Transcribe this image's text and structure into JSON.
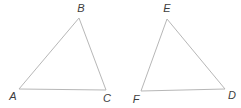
{
  "canvas": {
    "width": 241,
    "height": 108,
    "background": "#ffffff",
    "line_color": "#b7b7b7",
    "label_color": "#3d3d3d"
  },
  "figures": [
    {
      "name": "triangle-ABC",
      "vertices": [
        {
          "label": "A",
          "x": 19,
          "y": 89,
          "label_x": 13,
          "label_y": 96
        },
        {
          "label": "B",
          "x": 79,
          "y": 18,
          "label_x": 81,
          "label_y": 8
        },
        {
          "label": "C",
          "x": 106,
          "y": 90,
          "label_x": 107,
          "label_y": 98
        }
      ]
    },
    {
      "name": "triangle-FED",
      "vertices": [
        {
          "label": "F",
          "x": 141,
          "y": 91,
          "label_x": 136,
          "label_y": 99
        },
        {
          "label": "E",
          "x": 167,
          "y": 19,
          "label_x": 167,
          "label_y": 8
        },
        {
          "label": "D",
          "x": 225,
          "y": 89,
          "label_x": 232,
          "label_y": 95
        }
      ]
    }
  ]
}
